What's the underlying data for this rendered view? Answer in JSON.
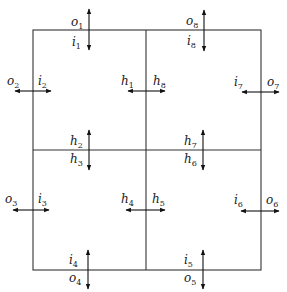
{
  "diagram": {
    "colors": {
      "line": "#333333",
      "text": "#222222",
      "background": "#ffffff"
    },
    "grid": {
      "left": 33,
      "top": 30,
      "right": 261,
      "bottom": 270,
      "mid_x": 146,
      "mid_y": 150
    },
    "labels": {
      "o1": {
        "base": "o",
        "sub": "1"
      },
      "i1": {
        "base": "i",
        "sub": "1"
      },
      "o2": {
        "base": "o",
        "sub": "2"
      },
      "i2": {
        "base": "i",
        "sub": "2"
      },
      "o3": {
        "base": "o",
        "sub": "3"
      },
      "i3": {
        "base": "i",
        "sub": "3"
      },
      "o4": {
        "base": "o",
        "sub": "4"
      },
      "i4": {
        "base": "i",
        "sub": "4"
      },
      "o5": {
        "base": "o",
        "sub": "5"
      },
      "i5": {
        "base": "i",
        "sub": "5"
      },
      "o6": {
        "base": "o",
        "sub": "6"
      },
      "i6": {
        "base": "i",
        "sub": "6"
      },
      "o7": {
        "base": "o",
        "sub": "7"
      },
      "i7": {
        "base": "i",
        "sub": "7"
      },
      "o8": {
        "base": "o",
        "sub": "8"
      },
      "i8": {
        "base": "i",
        "sub": "8"
      },
      "h1": {
        "base": "h",
        "sub": "1"
      },
      "h2": {
        "base": "h",
        "sub": "2"
      },
      "h3": {
        "base": "h",
        "sub": "3"
      },
      "h4": {
        "base": "h",
        "sub": "4"
      },
      "h5": {
        "base": "h",
        "sub": "5"
      },
      "h6": {
        "base": "h",
        "sub": "6"
      },
      "h7": {
        "base": "h",
        "sub": "7"
      },
      "h8": {
        "base": "h",
        "sub": "8"
      }
    },
    "arrows": [
      {
        "id": "o1-i1",
        "orientation": "vertical",
        "between": [
          "o1",
          "i1"
        ],
        "cell": "top-left",
        "edge": "top"
      },
      {
        "id": "o8-i8",
        "orientation": "vertical",
        "between": [
          "o8",
          "i8"
        ],
        "cell": "top-right",
        "edge": "top"
      },
      {
        "id": "o2-i2",
        "orientation": "horizontal",
        "between": [
          "o2",
          "i2"
        ],
        "cell": "top-left",
        "edge": "left"
      },
      {
        "id": "i7-o7",
        "orientation": "horizontal",
        "between": [
          "i7",
          "o7"
        ],
        "cell": "top-right",
        "edge": "right"
      },
      {
        "id": "h1-h8",
        "orientation": "horizontal",
        "between": [
          "h1",
          "h8"
        ],
        "edge": "middle-vertical-top"
      },
      {
        "id": "h2-h3",
        "orientation": "vertical",
        "between": [
          "h2",
          "h3"
        ],
        "edge": "middle-horizontal-left"
      },
      {
        "id": "h7-h6",
        "orientation": "vertical",
        "between": [
          "h7",
          "h6"
        ],
        "edge": "middle-horizontal-right"
      },
      {
        "id": "o3-i3",
        "orientation": "horizontal",
        "between": [
          "o3",
          "i3"
        ],
        "cell": "bottom-left",
        "edge": "left"
      },
      {
        "id": "h4-h5",
        "orientation": "horizontal",
        "between": [
          "h4",
          "h5"
        ],
        "edge": "middle-vertical-bottom"
      },
      {
        "id": "i6-o6",
        "orientation": "horizontal",
        "between": [
          "i6",
          "o6"
        ],
        "cell": "bottom-right",
        "edge": "right"
      },
      {
        "id": "i4-o4",
        "orientation": "vertical",
        "between": [
          "i4",
          "o4"
        ],
        "cell": "bottom-left",
        "edge": "bottom"
      },
      {
        "id": "i5-o5",
        "orientation": "vertical",
        "between": [
          "i5",
          "o5"
        ],
        "cell": "bottom-right",
        "edge": "bottom"
      }
    ]
  }
}
